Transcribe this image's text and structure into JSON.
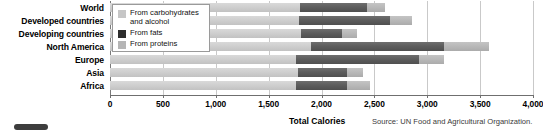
{
  "chart_data": {
    "type": "bar",
    "orientation": "horizontal",
    "stacked": true,
    "title": "",
    "xlabel": "Total Calories",
    "ylabel": "",
    "xlim": [
      0,
      4000
    ],
    "xticks": [
      0,
      500,
      1000,
      1500,
      2000,
      2500,
      3000,
      3500,
      4000
    ],
    "xtick_labels": [
      "0",
      "500",
      "1,000",
      "1,500",
      "2,000",
      "2,500",
      "3,000",
      "3,500",
      "4,000"
    ],
    "grid": true,
    "legend_position": "upper-left",
    "categories": [
      "World",
      "Developed countries",
      "Developing countries",
      "North America",
      "Europe",
      "Asia",
      "Africa"
    ],
    "series": [
      {
        "name": "From carbohydrates and alcohol",
        "color": "#cfcfcf",
        "values": [
          1800,
          1790,
          1810,
          1900,
          1760,
          1780,
          1760
        ]
      },
      {
        "name": "From fats",
        "color": "#5d5d5d",
        "values": [
          630,
          860,
          385,
          1260,
          1160,
          460,
          485
        ]
      },
      {
        "name": "From proteins",
        "color": "#b9b9b9",
        "values": [
          175,
          210,
          145,
          420,
          240,
          150,
          210
        ]
      }
    ],
    "totals": [
      2605,
      2860,
      2340,
      3580,
      3160,
      2390,
      2455
    ],
    "source": "Source: UN Food and Agricultural Organization."
  },
  "legend": {
    "items": [
      {
        "label": "From carbohydrates\nand alcohol",
        "swatch": "legend-swatch-carbohydrates"
      },
      {
        "label": "From fats",
        "swatch": "legend-swatch-fats"
      },
      {
        "label": "From proteins",
        "swatch": "legend-swatch-proteins"
      }
    ]
  },
  "axis": {
    "x_title": "Total Calories"
  },
  "footer": {
    "source": "Source: UN Food and Agricultural Organization."
  }
}
